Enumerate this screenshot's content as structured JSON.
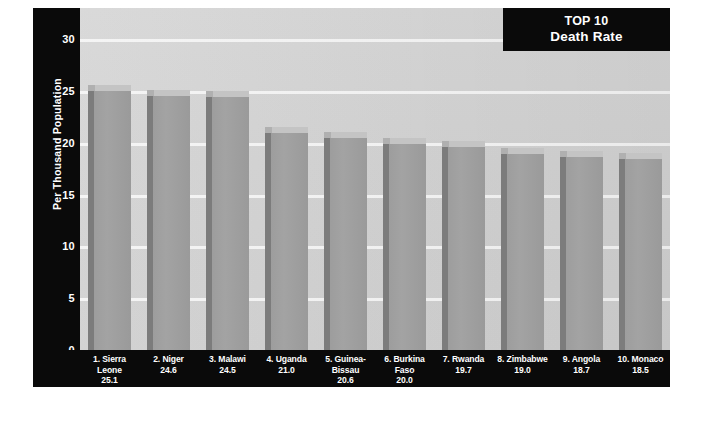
{
  "title": {
    "line1": "TOP 10",
    "line2": "Death Rate"
  },
  "axes": {
    "ylabel": "Per Thousand Population",
    "yticks": [
      "0",
      "5",
      "10",
      "15",
      "20",
      "25",
      "30"
    ]
  },
  "colors": {
    "plot_background": "#d2d2d2",
    "panel_black": "#0a0a0a",
    "bar_front": "#a0a0a0",
    "bar_side": "#7c7c7c",
    "bar_top": "#c4c4c4",
    "gridline": "#f4f4f4",
    "text_light": "#ffffff"
  },
  "chart_data": {
    "type": "bar",
    "title": "TOP 10 Death Rate",
    "xlabel": "",
    "ylabel": "Per Thousand Population",
    "ylim": [
      0,
      33
    ],
    "yticks": [
      0,
      5,
      10,
      15,
      20,
      25,
      30
    ],
    "grid": true,
    "legend": "none",
    "categories": [
      "1. Sierra Leone",
      "2. Niger",
      "3. Malawi",
      "4. Uganda",
      "5. Guinea-Bissau",
      "6. Burkina Faso",
      "7. Rwanda",
      "8. Zimbabwe",
      "9. Angola",
      "10. Monaco"
    ],
    "values": [
      25.1,
      24.6,
      24.5,
      21.0,
      20.6,
      20.0,
      19.7,
      19.0,
      18.7,
      18.5
    ],
    "bars": [
      {
        "rank": "1.",
        "name": "Sierra",
        "name2": "Leone",
        "value": "25.1",
        "num": 25.1
      },
      {
        "rank": "2.",
        "name": "Niger",
        "name2": "",
        "value": "24.6",
        "num": 24.6
      },
      {
        "rank": "3.",
        "name": "Malawi",
        "name2": "",
        "value": "24.5",
        "num": 24.5
      },
      {
        "rank": "4.",
        "name": "Uganda",
        "name2": "",
        "value": "21.0",
        "num": 21.0
      },
      {
        "rank": "5.",
        "name": "Guinea-",
        "name2": "Bissau",
        "value": "20.6",
        "num": 20.6
      },
      {
        "rank": "6.",
        "name": "Burkina",
        "name2": "Faso",
        "value": "20.0",
        "num": 20.0
      },
      {
        "rank": "7.",
        "name": "Rwanda",
        "name2": "",
        "value": "19.7",
        "num": 19.7
      },
      {
        "rank": "8.",
        "name": "Zimbabwe",
        "name2": "",
        "value": "19.0",
        "num": 19.0
      },
      {
        "rank": "9.",
        "name": "Angola",
        "name2": "",
        "value": "18.7",
        "num": 18.7
      },
      {
        "rank": "10.",
        "name": "Monaco",
        "name2": "",
        "value": "18.5",
        "num": 18.5
      }
    ]
  }
}
